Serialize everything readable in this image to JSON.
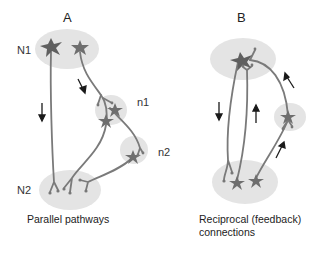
{
  "panels": [
    {
      "title": "A",
      "caption": "Parallel pathways",
      "node_labels": [
        "N1",
        "n1",
        "n2",
        "N2"
      ]
    },
    {
      "title": "B",
      "caption_line1": "Reciprocal (feedback)",
      "caption_line2": "connections"
    }
  ],
  "colors": {
    "region_fill": "#e4e4e4",
    "neuron": "#777777",
    "neuron_dark": "#5a5a5a",
    "arrow": "#1a1a1a",
    "text": "#222222"
  }
}
